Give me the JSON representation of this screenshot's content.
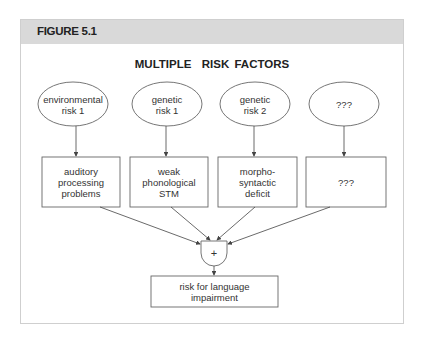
{
  "figure": {
    "label": "FIGURE 5.1",
    "title": "MULTIPLE  RISK FACTORS"
  },
  "causes": [
    {
      "label": "environmental\nrisk 1"
    },
    {
      "label": "genetic\nrisk 1"
    },
    {
      "label": "genetic\nrisk 2"
    },
    {
      "label": "???"
    }
  ],
  "deficits": [
    {
      "label": "auditory\nprocessing\nproblems"
    },
    {
      "label": "weak\nphonological\nSTM"
    },
    {
      "label": "morpho-\nsyntactic\ndeficit"
    },
    {
      "label": "???"
    }
  ],
  "combiner": {
    "symbol": "+"
  },
  "outcome": {
    "label": "risk for language\nimpairment"
  },
  "colors": {
    "header_bg": "#d9d9d9",
    "stroke": "#555555",
    "frame": "#cfcfcf"
  }
}
